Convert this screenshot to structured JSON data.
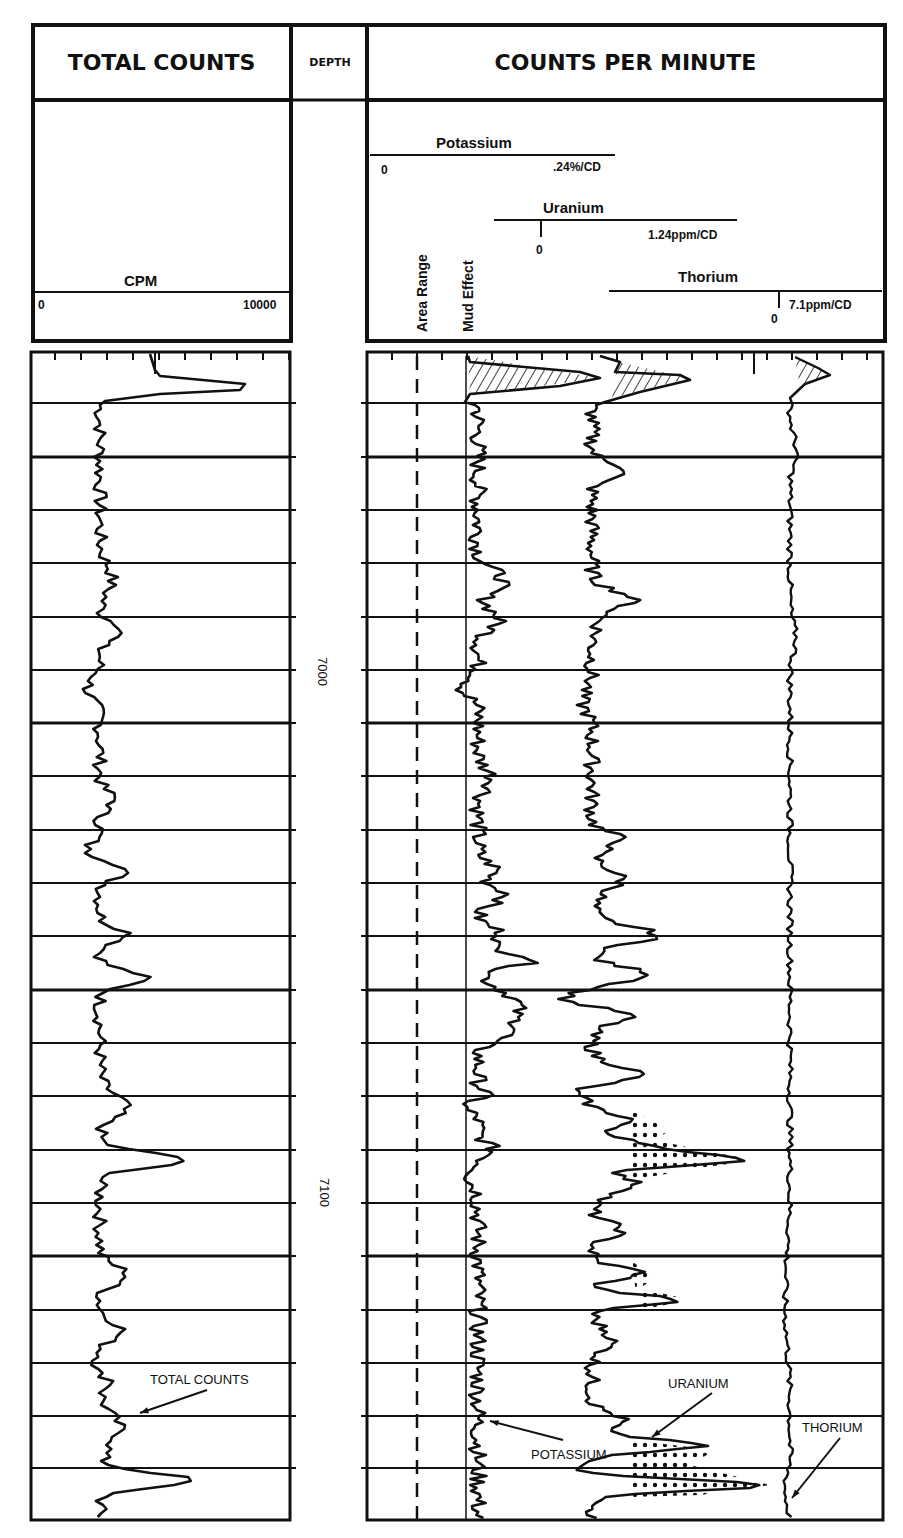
{
  "header": {
    "total_counts_title": "TOTAL COUNTS",
    "depth_title": "DEPTH",
    "cpm_title": "COUNTS PER MINUTE"
  },
  "left_scale": {
    "label": "CPM",
    "min": "0",
    "max": "10000"
  },
  "right_scales": {
    "potassium": {
      "label": "Potassium",
      "min": "0",
      "max": ".24%/CD"
    },
    "uranium": {
      "label": "Uranium",
      "min": "0",
      "max": "1.24ppm/CD"
    },
    "thorium": {
      "label": "Thorium",
      "min": "0",
      "max": "7.1ppm/CD"
    },
    "area_range": "Area Range",
    "mud_effect": "Mud Effect"
  },
  "depth_marks": [
    "7000",
    "7100"
  ],
  "annotations": {
    "total_counts": "TOTAL COUNTS",
    "uranium": "URANIUM",
    "potassium": "POTASSIUM",
    "thorium": "THORIUM"
  },
  "chart_data": {
    "type": "line",
    "xlabel": "",
    "ylabel": "Depth",
    "panels": [
      {
        "name": "TOTAL COUNTS",
        "x_unit": "CPM",
        "xlim": [
          0,
          10000
        ],
        "series": [
          {
            "name": "Total Counts"
          }
        ]
      },
      {
        "name": "COUNTS PER MINUTE",
        "series": [
          {
            "name": "Potassium",
            "scale": "0 to .24%/CD"
          },
          {
            "name": "Uranium",
            "scale": "0 to 1.24ppm/CD",
            "fill": "dotted peaks"
          },
          {
            "name": "Thorium",
            "scale": "0 to 7.1ppm/CD"
          },
          {
            "name": "Area Range",
            "style": "dashed"
          },
          {
            "name": "Mud Effect",
            "style": "solid"
          }
        ]
      }
    ],
    "depth_ticks": [
      7000,
      7100
    ],
    "grid": true,
    "total_counts_profile_cpm_approx": [
      {
        "depth_row": 0,
        "cpm": 8200
      },
      {
        "depth_row": 1,
        "cpm": 2800
      },
      {
        "depth_row": 2,
        "cpm": 2900
      },
      {
        "depth_row": 3,
        "cpm": 3000
      },
      {
        "depth_row": 4,
        "cpm": 3200
      },
      {
        "depth_row": 5,
        "cpm": 4000
      },
      {
        "depth_row": 6,
        "cpm": 2600
      },
      {
        "depth_row": 7,
        "cpm": 3100
      },
      {
        "depth_row": 8,
        "cpm": 3300
      },
      {
        "depth_row": 9,
        "cpm": 3900
      },
      {
        "depth_row": 10,
        "cpm": 4600
      },
      {
        "depth_row": 11,
        "cpm": 5800
      },
      {
        "depth_row": 12,
        "cpm": 4000
      },
      {
        "depth_row": 13,
        "cpm": 3300
      },
      {
        "depth_row": 14,
        "cpm": 3900
      },
      {
        "depth_row": 15,
        "cpm": 7000
      },
      {
        "depth_row": 16,
        "cpm": 3800
      },
      {
        "depth_row": 17,
        "cpm": 4200
      },
      {
        "depth_row": 18,
        "cpm": 3500
      },
      {
        "depth_row": 19,
        "cpm": 3700
      },
      {
        "depth_row": 20,
        "cpm": 3800
      },
      {
        "depth_row": 21,
        "cpm": 7300
      }
    ]
  }
}
